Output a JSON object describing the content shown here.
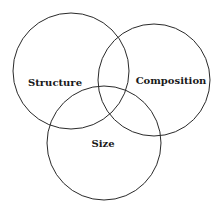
{
  "diagram": {
    "type": "venn",
    "circles": [
      {
        "id": "structure",
        "label": "Structure",
        "cx": 71,
        "cy": 71,
        "r": 58,
        "label_x": 55,
        "label_y": 86
      },
      {
        "id": "composition",
        "label": "Composition",
        "cx": 154,
        "cy": 80,
        "r": 56,
        "label_x": 171,
        "label_y": 84
      },
      {
        "id": "size",
        "label": "Size",
        "cx": 104,
        "cy": 143,
        "r": 57,
        "label_x": 103,
        "label_y": 147
      }
    ],
    "stroke_color": "#2a2a2a",
    "text_color": "#1a1a1a",
    "background": "#ffffff"
  }
}
